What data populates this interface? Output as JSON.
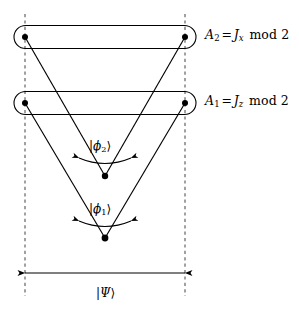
{
  "figure": {
    "background_color": "#ffffff",
    "stroke_color": "#000000",
    "dash_color": "#555555"
  },
  "operator_labels": [
    {
      "id": "A2",
      "symbol": "A",
      "symbol_subscript": "2",
      "equals": "=",
      "operator": "J",
      "operator_subscript": "x",
      "modulus_text": "mod 2",
      "full_text": "A2 = Jx mod 2"
    },
    {
      "id": "A1",
      "symbol": "A",
      "symbol_subscript": "1",
      "equals": "=",
      "operator": "J",
      "operator_subscript": "z",
      "modulus_text": "mod 2",
      "full_text": "A1 = Jz mod 2"
    }
  ],
  "state_labels": [
    {
      "id": "phi2",
      "bra_bar": "|",
      "symbol": "ϕ",
      "subscript": "2",
      "ket_bar": "⟩",
      "full_text": "|ϕ₂⟩"
    },
    {
      "id": "phi1",
      "bra_bar": "|",
      "symbol": "ϕ",
      "subscript": "1",
      "ket_bar": "⟩",
      "full_text": "|ϕ₁⟩"
    }
  ],
  "global_state_label": {
    "id": "psi",
    "bra_bar": "|",
    "symbol": "Ψ",
    "ket_bar": "⟩",
    "full_text": "|Ψ⟩"
  },
  "geometry": {
    "width": 299,
    "height": 311,
    "dashed_line_left_x": 25,
    "dashed_line_right_x": 185,
    "dashed_line_top_y": 14,
    "dashed_line_bottom_y": 296,
    "group_upper_y": 37,
    "group_lower_y": 103,
    "apex_inner_x": 105,
    "apex_inner_y": 176,
    "apex_outer_x": 105,
    "apex_outer_y": 238,
    "dimension_arrow_y": 273,
    "node_radius": 3
  }
}
